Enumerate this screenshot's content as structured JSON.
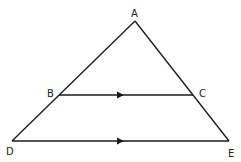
{
  "diagram": {
    "type": "triangle with parallel segment",
    "points": {
      "A": {
        "label": "A",
        "x": 135,
        "y": 21
      },
      "B": {
        "label": "B",
        "x": 59,
        "y": 95
      },
      "C": {
        "label": "C",
        "x": 193,
        "y": 95
      },
      "D": {
        "label": "D",
        "x": 12,
        "y": 141
      },
      "E": {
        "label": "E",
        "x": 229,
        "y": 141
      }
    },
    "segments": [
      "AD",
      "AE",
      "BC",
      "DE"
    ],
    "parallel_marks": [
      "BC",
      "DE"
    ],
    "line_color": "#1a1a1a"
  }
}
